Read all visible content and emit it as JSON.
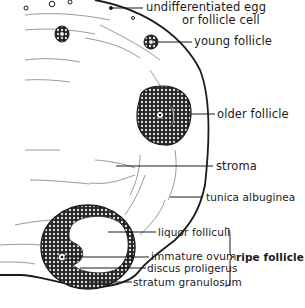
{
  "diagram": {
    "labels": {
      "undifferentiated_egg_line1": "undifferentiated egg",
      "undifferentiated_egg_line2": "or follicle cell",
      "young_follicle": "young follicle",
      "older_follicle": "older follicle",
      "stroma": "stroma",
      "tunica_albuginea": "tunica albuginea",
      "liquor_folliculi": "liquor folliculi",
      "immature_ovum": "immature ovum",
      "discus_proligerus": "discus proligerus",
      "stratum_granulosum": "stratum granulosum",
      "ripe_follicle": "ripe follicle"
    },
    "colors": {
      "ink": "#1a1a1a",
      "background": "#ffffff"
    }
  }
}
